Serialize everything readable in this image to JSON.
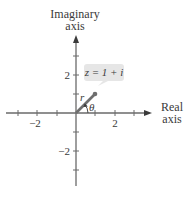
{
  "axes": {
    "vertical_label_line1": "Imaginary",
    "vertical_label_line2": "axis",
    "horizontal_label_line1": "Real",
    "horizontal_label_line2": "axis"
  },
  "ticks": {
    "x_pos_2": "2",
    "x_neg_2": "−2",
    "y_pos_2": "2",
    "y_neg_2": "−2"
  },
  "point": {
    "label": "z = 1 + i",
    "modulus_label": "r",
    "angle_label": "θ"
  },
  "colors": {
    "axis": "#6a6a6a",
    "vector": "#6e6e6e",
    "label_box": "#e6e6e6",
    "text": "#3a3a3a"
  }
}
